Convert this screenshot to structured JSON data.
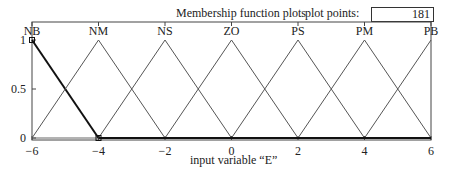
{
  "header": {
    "title": "Membership function plots",
    "plot_points_label": "plot points:",
    "plot_points_value": "181"
  },
  "chart_data": {
    "type": "line",
    "title": "Membership function plots",
    "xlabel": "input variable  “E”",
    "ylabel": "",
    "xlim": [
      -6,
      6
    ],
    "ylim": [
      0,
      1
    ],
    "x_ticks": [
      -6,
      -4,
      -2,
      0,
      2,
      4,
      6
    ],
    "x_tick_labels": [
      "−6",
      "−4",
      "−2",
      "0",
      "2",
      "4",
      "6"
    ],
    "y_ticks": [
      0,
      0.5,
      1
    ],
    "y_tick_labels": [
      "0",
      "0.5",
      "1"
    ],
    "grid": false,
    "selected_series": "NB",
    "series": [
      {
        "name": "NB",
        "x": [
          -6,
          -6,
          -4
        ],
        "y": [
          1,
          1,
          0
        ],
        "selected": true
      },
      {
        "name": "NM",
        "x": [
          -6,
          -4,
          -2
        ],
        "y": [
          0,
          1,
          0
        ]
      },
      {
        "name": "NS",
        "x": [
          -4,
          -2,
          0
        ],
        "y": [
          0,
          1,
          0
        ]
      },
      {
        "name": "ZO",
        "x": [
          -2,
          0,
          2
        ],
        "y": [
          0,
          1,
          0
        ]
      },
      {
        "name": "PS",
        "x": [
          0,
          2,
          4
        ],
        "y": [
          0,
          1,
          0
        ]
      },
      {
        "name": "PM",
        "x": [
          2,
          4,
          6
        ],
        "y": [
          0,
          1,
          0
        ]
      },
      {
        "name": "PB",
        "x": [
          4,
          6,
          6
        ],
        "y": [
          0,
          1,
          1
        ]
      }
    ],
    "plot_points": 181
  }
}
